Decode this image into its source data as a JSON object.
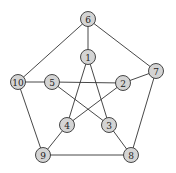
{
  "graph": {
    "name": "Petersen graph",
    "nodes": [
      {
        "id": "1",
        "label": "1",
        "x": 88,
        "y": 57
      },
      {
        "id": "2",
        "label": "2",
        "x": 123,
        "y": 83
      },
      {
        "id": "3",
        "label": "3",
        "x": 109,
        "y": 125
      },
      {
        "id": "4",
        "label": "4",
        "x": 67,
        "y": 125
      },
      {
        "id": "5",
        "label": "5",
        "x": 52,
        "y": 82
      },
      {
        "id": "6",
        "label": "6",
        "x": 88,
        "y": 19
      },
      {
        "id": "7",
        "label": "7",
        "x": 156,
        "y": 71
      },
      {
        "id": "8",
        "label": "8",
        "x": 131,
        "y": 155
      },
      {
        "id": "9",
        "label": "9",
        "x": 43,
        "y": 155
      },
      {
        "id": "10",
        "label": "10",
        "x": 18,
        "y": 82
      }
    ],
    "edges": [
      [
        "6",
        "1"
      ],
      [
        "6",
        "7"
      ],
      [
        "6",
        "10"
      ],
      [
        "7",
        "2"
      ],
      [
        "7",
        "8"
      ],
      [
        "8",
        "9"
      ],
      [
        "8",
        "3"
      ],
      [
        "9",
        "10"
      ],
      [
        "9",
        "4"
      ],
      [
        "10",
        "5"
      ],
      [
        "1",
        "3"
      ],
      [
        "1",
        "4"
      ],
      [
        "2",
        "4"
      ],
      [
        "2",
        "5"
      ],
      [
        "3",
        "5"
      ]
    ],
    "colors": {
      "node_fill": "#d4d4d4",
      "node_stroke": "#333333",
      "edge": "#333333",
      "background": "#ffffff"
    }
  }
}
